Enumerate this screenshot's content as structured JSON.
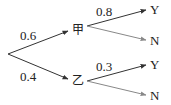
{
  "diagram": {
    "type": "probability-tree",
    "root": {
      "branches": [
        {
          "node": "甲",
          "probability": "0.6",
          "branches": [
            {
              "outcome": "Y",
              "probability": "0.8"
            },
            {
              "outcome": "N",
              "probability": ""
            }
          ]
        },
        {
          "node": "乙",
          "probability": "0.4",
          "branches": [
            {
              "outcome": "Y",
              "probability": "0.3"
            },
            {
              "outcome": "N",
              "probability": ""
            }
          ]
        }
      ]
    }
  }
}
